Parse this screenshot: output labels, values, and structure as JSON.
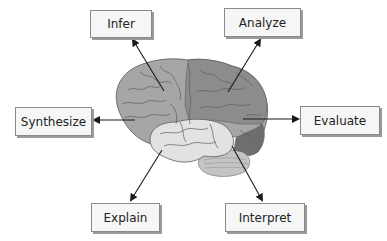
{
  "diagram": {
    "labels": {
      "infer": "Infer",
      "analyze": "Analyze",
      "synthesize": "Synthesize",
      "evaluate": "Evaluate",
      "explain": "Explain",
      "interpret": "Interpret"
    },
    "colors": {
      "frontal_lobe": "#a6a6a6",
      "parietal_lobe": "#8c8c8c",
      "occipital_lobe": "#6e6e6e",
      "temporal_lobe": "#e2e2e2",
      "cerebellum": "#c4c4c4",
      "outline": "#5a5a5a",
      "arrow": "#1a1a1a",
      "box_fill": "#f6f6f6",
      "box_border": "#8a8a8a"
    }
  }
}
